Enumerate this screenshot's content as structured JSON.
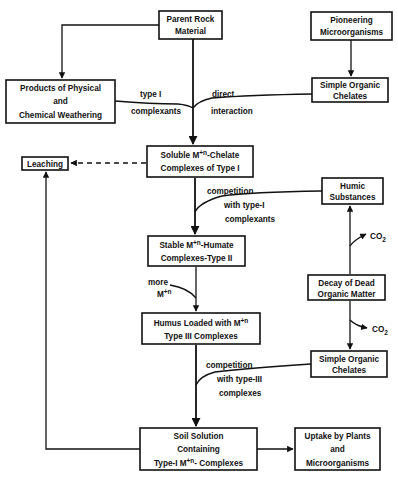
{
  "diagram": {
    "nodes": {
      "parent_rock": [
        "Parent Rock",
        "Material"
      ],
      "pioneering": [
        "Pioneering",
        "Microorganisms"
      ],
      "products": [
        "Products of Physical",
        "and",
        "Chemical   Weathering"
      ],
      "simple_chelates_top": [
        "Simple Organic",
        "Chelates"
      ],
      "leaching": "Leaching",
      "soluble": {
        "line1_pre": "Soluble M",
        "line1_sup": "+n",
        "line1_post": "-Chelate",
        "line2": "Complexes of Type I"
      },
      "humic": [
        "Humic",
        "Substances"
      ],
      "stable": {
        "line1_pre": "Stable M",
        "line1_sup": "+n",
        "line1_post": "-Humate",
        "line2": "Complexes-Type II"
      },
      "decay": [
        "Decay of Dead",
        "Organic Matter"
      ],
      "humus": {
        "line1_pre": "Humus Loaded with M",
        "line1_sup": "+n",
        "line2": "Type III Complexes"
      },
      "simple_chelates_bottom": [
        "Simple Organic",
        "Chelates"
      ],
      "soil_solution": {
        "line1": "Soil Solution",
        "line2": "Containing",
        "line3_pre": "Type-I M",
        "line3_sup": "+n",
        "line3_post": "- Complexes"
      },
      "uptake": [
        "Uptake by Plants",
        "and",
        "Microorganisms"
      ]
    },
    "edge_labels": {
      "type1_complexants": [
        "type I",
        "complexants"
      ],
      "direct_interaction": [
        "direct",
        "interaction"
      ],
      "competition_type1": [
        "competition",
        "with type-I",
        "complexants"
      ],
      "more_m": {
        "line1": "more",
        "line2_pre": "M",
        "line2_sup": "+n"
      },
      "competition_type3": [
        "competition",
        "with type-III",
        "complexes"
      ],
      "co2_upper": {
        "base": "CO",
        "sub": "2"
      },
      "co2_lower": {
        "base": "CO",
        "sub": "2"
      }
    }
  }
}
